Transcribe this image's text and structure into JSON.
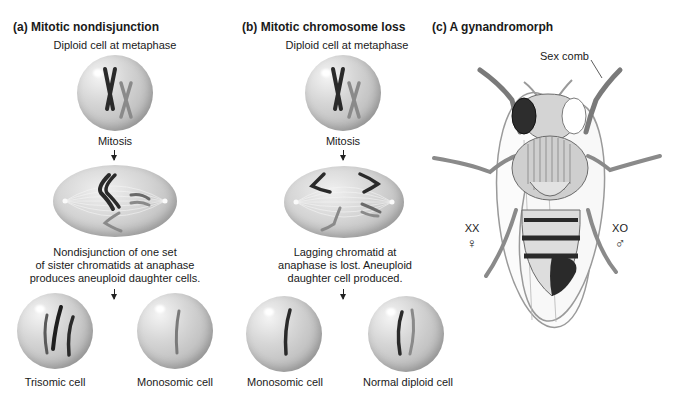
{
  "panel_a": {
    "title": "(a)  Mitotic nondisjunction",
    "top_label": "Diploid cell at metaphase",
    "step_label": "Mitosis",
    "caption_lines": [
      "Nondisjunction of one set",
      "of sister chromatids at anaphase",
      "produces aneuploid daughter cells."
    ],
    "daughters": [
      {
        "label": "Trisomic cell"
      },
      {
        "label": "Monosomic cell"
      }
    ]
  },
  "panel_b": {
    "title": "(b)  Mitotic chromosome loss",
    "top_label": "Diploid cell at metaphase",
    "step_label": "Mitosis",
    "caption_lines": [
      "Lagging chromatid at",
      "anaphase is lost. Aneuploid",
      "daughter cell produced."
    ],
    "daughters": [
      {
        "label": "Monosomic cell"
      },
      {
        "label": "Normal diploid cell"
      }
    ]
  },
  "panel_c": {
    "title": "(c)  A gynandromorph",
    "sex_comb_label": "Sex comb",
    "left_side": {
      "genotype": "XX",
      "symbol": "♀"
    },
    "right_side": {
      "genotype": "XO",
      "symbol": "♂"
    }
  },
  "colors": {
    "dark_chromosome": "#2a2a2a",
    "light_chromosome": "#8a8a8a",
    "cell_fill": "#c8c8c8"
  }
}
